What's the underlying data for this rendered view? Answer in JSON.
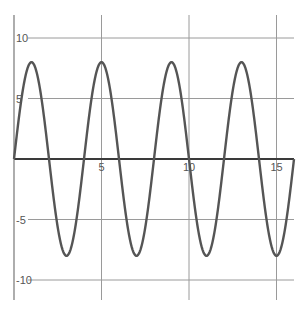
{
  "chart_data": {
    "type": "line",
    "title": "",
    "xlabel": "",
    "ylabel": "",
    "function": "y = 8*sin(pi*x/2)",
    "amplitude": 8,
    "period": 4,
    "xlim": [
      0,
      16
    ],
    "ylim": [
      -10,
      10
    ],
    "x_ticks": [
      5,
      10,
      15
    ],
    "y_ticks": [
      10,
      5,
      -5,
      -10
    ],
    "x_tick_labels": [
      "5",
      "10",
      "15"
    ],
    "y_tick_labels": [
      "10",
      "5",
      "-5",
      "-10"
    ],
    "grid": true,
    "series": [
      {
        "name": "curve",
        "x": [
          0,
          1,
          2,
          3,
          4,
          5,
          6,
          7,
          8,
          9,
          10,
          11,
          12,
          13,
          14,
          15,
          16
        ],
        "values": [
          0,
          8,
          0,
          -8,
          0,
          8,
          0,
          -8,
          0,
          8,
          0,
          -8,
          0,
          8,
          0,
          -8,
          0
        ]
      }
    ],
    "line_color": "#555555",
    "axis_color": "#3a3a3a",
    "grid_color": "#9a9a9a"
  }
}
